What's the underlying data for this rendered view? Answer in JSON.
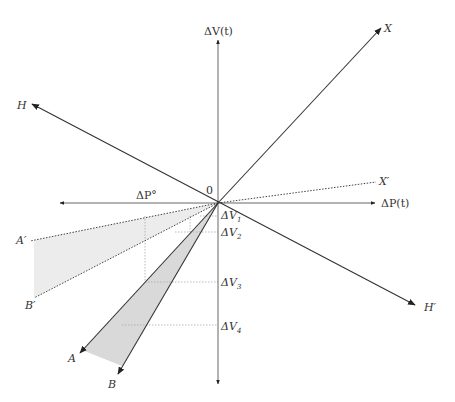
{
  "diagram": {
    "origin_label": "0",
    "axes": {
      "vertical_label": "ΔV(t)",
      "horizontal_label": "ΔP(t)",
      "horizontal_negative_label": "ΔP°"
    },
    "lines": {
      "X": "X",
      "X_prime": "X′",
      "H": "H",
      "H_prime": "H′",
      "A": "A",
      "B": "B",
      "A_prime": "A′",
      "B_prime": "B′"
    },
    "levels": [
      {
        "base": "ΔV",
        "sub": "1"
      },
      {
        "base": "ΔV",
        "sub": "2"
      },
      {
        "base": "ΔV",
        "sub": "3"
      },
      {
        "base": "ΔV",
        "sub": "4"
      }
    ],
    "colors": {
      "line": "#333333",
      "dotted": "#999999",
      "fill_light": "#ececec",
      "fill_dark": "#d6d6d6"
    }
  }
}
